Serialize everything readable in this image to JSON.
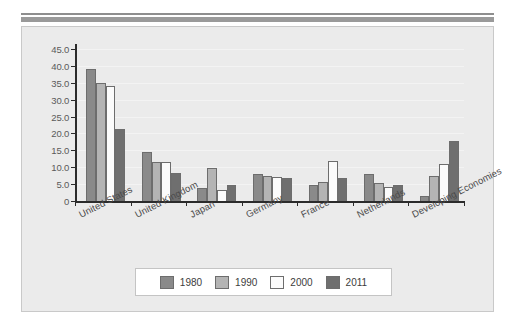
{
  "figure": {
    "background_color": "#ebebeb",
    "rule_color": "#9a9a9a"
  },
  "chart_data": {
    "type": "bar",
    "title": "",
    "xlabel": "",
    "ylabel": "",
    "ylim": [
      0,
      45
    ],
    "grid": true,
    "legend_position": "bottom",
    "categories": [
      "United States",
      "United Kingdom",
      "Japan",
      "Germany",
      "France",
      "Netherlands",
      "Developing Economies"
    ],
    "ytick_labels": [
      "0",
      "5.0",
      "10.0",
      "15.0",
      "20.0",
      "25.0",
      "30.0",
      "35.0",
      "40.0",
      "45.0"
    ],
    "ytick_values": [
      0,
      5,
      10,
      15,
      20,
      25,
      30,
      35,
      40,
      45
    ],
    "series": [
      {
        "name": "1980",
        "color": "#8a8a8a",
        "values": [
          39.2,
          14.6,
          3.9,
          8.1,
          4.7,
          7.9,
          1.4
        ]
      },
      {
        "name": "1990",
        "color": "#b4b4b4",
        "values": [
          35.0,
          11.6,
          9.7,
          7.3,
          5.5,
          5.2,
          7.3
        ]
      },
      {
        "name": "2000",
        "color": "#fbfbfb",
        "values": [
          34.0,
          11.5,
          3.4,
          7.0,
          11.8,
          4.1,
          10.9
        ]
      },
      {
        "name": "2011",
        "color": "#6f6f6f",
        "values": [
          21.3,
          8.4,
          4.6,
          6.8,
          6.7,
          4.6,
          17.7
        ]
      }
    ]
  },
  "legend": {
    "items": [
      {
        "label": "1980"
      },
      {
        "label": "1990"
      },
      {
        "label": "2000"
      },
      {
        "label": "2011"
      }
    ]
  }
}
